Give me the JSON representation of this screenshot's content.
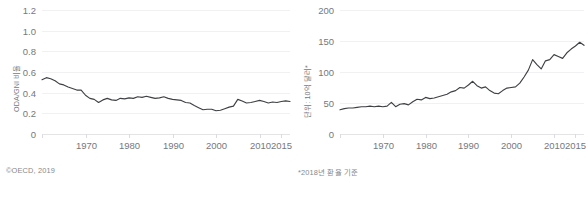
{
  "figure": {
    "background": "#ffffff",
    "line_color": "#3f4044",
    "grid_color": "#f1f1f3",
    "text_color": "#76787d"
  },
  "panels": {
    "left": {
      "caption": "©OECD, 2019",
      "axis_title": "ODA/GNI 비율"
    },
    "right": {
      "caption": "*2018년 환율 기준",
      "axis_title": "단위: 10억 달러*"
    }
  },
  "chart_data": [
    {
      "type": "line",
      "title": "",
      "xlabel": "",
      "ylabel": "ODA/GNI 비율",
      "xlim": [
        1960,
        2017
      ],
      "ylim": [
        0,
        1.2
      ],
      "grid": true,
      "legend": "none",
      "yticks": [
        0,
        0.2,
        0.4,
        0.6,
        0.8,
        1.0,
        1.2
      ],
      "ytick_labels": [
        "0",
        "0.2",
        "0.4",
        "0.6",
        "0.8",
        "1.0",
        "1.2"
      ],
      "xticks": [
        1970,
        1980,
        1990,
        2000,
        2010,
        2015
      ],
      "xtick_labels": [
        "1970",
        "1980",
        "1990",
        "2000",
        "2010",
        "2015"
      ],
      "x": [
        1960,
        1961,
        1962,
        1963,
        1964,
        1965,
        1966,
        1967,
        1968,
        1969,
        1970,
        1971,
        1972,
        1973,
        1974,
        1975,
        1976,
        1977,
        1978,
        1979,
        1980,
        1981,
        1982,
        1983,
        1984,
        1985,
        1986,
        1987,
        1988,
        1989,
        1990,
        1991,
        1992,
        1993,
        1994,
        1995,
        1996,
        1997,
        1998,
        1999,
        2000,
        2001,
        2002,
        2003,
        2004,
        2005,
        2006,
        2007,
        2008,
        2009,
        2010,
        2011,
        2012,
        2013,
        2014,
        2015,
        2016,
        2017
      ],
      "values": [
        0.525,
        0.545,
        0.535,
        0.515,
        0.485,
        0.475,
        0.455,
        0.44,
        0.425,
        0.425,
        0.375,
        0.345,
        0.335,
        0.305,
        0.33,
        0.345,
        0.33,
        0.325,
        0.345,
        0.34,
        0.35,
        0.345,
        0.36,
        0.355,
        0.365,
        0.355,
        0.345,
        0.35,
        0.36,
        0.345,
        0.335,
        0.33,
        0.325,
        0.305,
        0.3,
        0.275,
        0.255,
        0.235,
        0.24,
        0.24,
        0.225,
        0.23,
        0.245,
        0.26,
        0.27,
        0.335,
        0.32,
        0.3,
        0.305,
        0.315,
        0.325,
        0.315,
        0.3,
        0.31,
        0.305,
        0.315,
        0.32,
        0.315
      ]
    },
    {
      "type": "line",
      "title": "",
      "xlabel": "",
      "ylabel": "단위: 10억 달러*",
      "xlim": [
        1960,
        2017
      ],
      "ylim": [
        0,
        200
      ],
      "grid": true,
      "legend": "none",
      "yticks": [
        0,
        50,
        100,
        150,
        200
      ],
      "ytick_labels": [
        "0",
        "50",
        "100",
        "150",
        "200"
      ],
      "xticks": [
        1970,
        1980,
        1990,
        2000,
        2010,
        2015
      ],
      "xtick_labels": [
        "1970",
        "1980",
        "1990",
        "2000",
        "2010",
        "2015"
      ],
      "x": [
        1960,
        1961,
        1962,
        1963,
        1964,
        1965,
        1966,
        1967,
        1968,
        1969,
        1970,
        1971,
        1972,
        1973,
        1974,
        1975,
        1976,
        1977,
        1978,
        1979,
        1980,
        1981,
        1982,
        1983,
        1984,
        1985,
        1986,
        1987,
        1988,
        1989,
        1990,
        1991,
        1992,
        1993,
        1994,
        1995,
        1996,
        1997,
        1998,
        1999,
        2000,
        2001,
        2002,
        2003,
        2004,
        2005,
        2006,
        2007,
        2008,
        2009,
        2010,
        2011,
        2012,
        2013,
        2014,
        2015,
        2016,
        2017
      ],
      "values": [
        39,
        41,
        42,
        42,
        43,
        44,
        44,
        45,
        44,
        45,
        44,
        45,
        51,
        44,
        48,
        49,
        47,
        52,
        56,
        55,
        59,
        57,
        58,
        60,
        62,
        64,
        68,
        70,
        75,
        74,
        79,
        85,
        78,
        74,
        76,
        70,
        66,
        65,
        70,
        74,
        75,
        76,
        82,
        92,
        103,
        120,
        112,
        105,
        118,
        120,
        128,
        125,
        122,
        131,
        137,
        142,
        148,
        143
      ]
    }
  ]
}
